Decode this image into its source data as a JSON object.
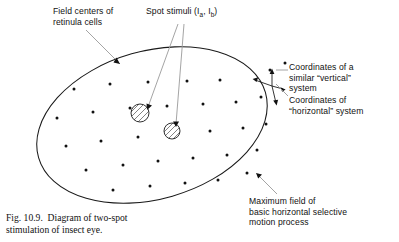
{
  "figure": {
    "caption": "Fig. 10.9.  Diagram of two-spot\nstimulation of insect eye.",
    "caption_number": "Fig. 10.9.",
    "caption_body": "Diagram of two-spot stimulation of insect eye."
  },
  "labels": {
    "field_centers": "Field centers of\nretinula cells",
    "spot_stimuli_prefix": "Spot stimuli (I",
    "spot_stimuli_sub_a": "a",
    "spot_stimuli_mid": ", I",
    "spot_stimuli_sub_b": "b",
    "spot_stimuli_suffix": ")",
    "spot_stimuli_plain": "Spot stimuli (Ia, Ib)",
    "vertical_system": "Coordinates of a\nsimilar “vertical”\nsystem",
    "horizontal_system": "Coordinates of\n“horizontal” system",
    "maximum_field": "Maximum field of\nbasic horizontal selective\nmotion process"
  },
  "colors": {
    "ink": "#111111",
    "background": "#ffffff",
    "leader": "#9a9a9a",
    "outline": "#1a1a1a"
  },
  "diagram": {
    "eye_field": {
      "shape": "ellipse",
      "center_x": 152,
      "center_y": 125,
      "radius_x": 118,
      "radius_y": 74,
      "rotation_deg": -16
    },
    "retinula_dot_radius": 1.5,
    "retinula_dots": [
      [
        74,
        89
      ],
      [
        110,
        84
      ],
      [
        148,
        82
      ],
      [
        187,
        81
      ],
      [
        220,
        80
      ],
      [
        57,
        118
      ],
      [
        93,
        112
      ],
      [
        130,
        108
      ],
      [
        167,
        106
      ],
      [
        203,
        104
      ],
      [
        236,
        102
      ],
      [
        261,
        97
      ],
      [
        66,
        146
      ],
      [
        101,
        141
      ],
      [
        138,
        137
      ],
      [
        175,
        134
      ],
      [
        210,
        131
      ],
      [
        243,
        128
      ],
      [
        266,
        124
      ],
      [
        86,
        170
      ],
      [
        123,
        165
      ],
      [
        158,
        161
      ],
      [
        193,
        158
      ],
      [
        227,
        155
      ],
      [
        257,
        150
      ],
      [
        113,
        190
      ],
      [
        150,
        186
      ],
      [
        185,
        183
      ],
      [
        218,
        180
      ],
      [
        247,
        173
      ],
      [
        270,
        70
      ],
      [
        285,
        63
      ]
    ],
    "spot_stimuli": [
      {
        "name": "spot-a",
        "cx": 140,
        "cy": 113,
        "r": 9
      },
      {
        "name": "spot-b",
        "cx": 172,
        "cy": 131,
        "r": 8
      }
    ]
  }
}
